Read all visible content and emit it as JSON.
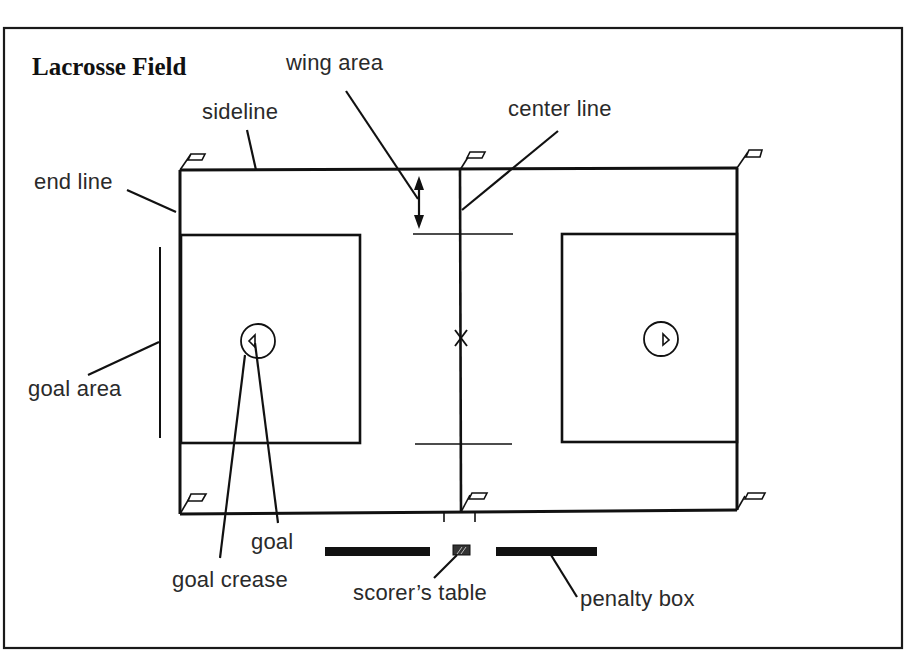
{
  "title": "Lacrosse Field",
  "labels": {
    "wing_area": "wing area",
    "sideline": "sideline",
    "center_line": "center line",
    "end_line": "end line",
    "goal_area": "goal area",
    "goal": "goal",
    "goal_crease": "goal crease",
    "scorers_table": "scorer’s table",
    "penalty_box": "penalty box"
  },
  "colors": {
    "line": "#111111",
    "background": "#ffffff",
    "text": "#2a2a2a"
  },
  "field": {
    "boundary": {
      "x1": 180,
      "y1": 170,
      "x2": 737,
      "y2": 514
    },
    "center_line_x": 460,
    "center_mark": {
      "x": 460,
      "y": 338
    },
    "left_goal_area": {
      "x1": 180,
      "y1": 235,
      "x2": 360,
      "y2": 443
    },
    "right_goal_area": {
      "x1": 562,
      "y1": 234,
      "x2": 737,
      "y2": 442
    },
    "wing_lines": [
      {
        "x1": 415,
        "x2": 512,
        "y": 235
      },
      {
        "x1": 415,
        "x2": 512,
        "y": 444
      }
    ],
    "left_goal_crease": {
      "cx": 258,
      "cy": 341,
      "r": 17
    },
    "right_goal_crease": {
      "cx": 661,
      "cy": 339,
      "r": 17
    },
    "corner_flags": 6
  },
  "sideline_items": {
    "left_penalty_bench": {
      "x1": 325,
      "x2": 430,
      "y": 551
    },
    "scorers_table": {
      "x1": 453,
      "x2": 470,
      "y": 551
    },
    "right_penalty_bench": {
      "x1": 496,
      "x2": 597,
      "y": 551
    }
  }
}
